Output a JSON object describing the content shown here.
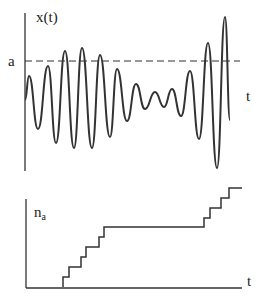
{
  "top_plot": {
    "y_label": "x(t)",
    "x_label": "t",
    "threshold_label": "a",
    "threshold_style": "dashed",
    "wave_points": [
      [
        25,
        100
      ],
      [
        29,
        76
      ],
      [
        38,
        129
      ],
      [
        48,
        66
      ],
      [
        56,
        143
      ],
      [
        65,
        51
      ],
      [
        74,
        148
      ],
      [
        82,
        48
      ],
      [
        92,
        148
      ],
      [
        100,
        55
      ],
      [
        110,
        137
      ],
      [
        117,
        69
      ],
      [
        127,
        121
      ],
      [
        136,
        84
      ],
      [
        145,
        109
      ],
      [
        155,
        92
      ],
      [
        164,
        107
      ],
      [
        172,
        89
      ],
      [
        181,
        116
      ],
      [
        190,
        71
      ],
      [
        199,
        139
      ],
      [
        208,
        43
      ],
      [
        217,
        168
      ],
      [
        225,
        17
      ],
      [
        230,
        120
      ]
    ]
  },
  "bottom_plot": {
    "y_label_main": "n",
    "y_label_sub": "a",
    "x_label": "t",
    "step_points": [
      [
        63,
        287
      ],
      [
        63,
        277
      ],
      [
        69,
        277
      ],
      [
        69,
        267
      ],
      [
        81,
        267
      ],
      [
        81,
        257
      ],
      [
        86,
        257
      ],
      [
        86,
        247
      ],
      [
        99,
        247
      ],
      [
        99,
        237
      ],
      [
        104,
        237
      ],
      [
        104,
        227
      ],
      [
        204,
        227
      ],
      [
        204,
        218
      ],
      [
        210,
        218
      ],
      [
        210,
        208
      ],
      [
        221,
        208
      ],
      [
        221,
        198
      ],
      [
        229,
        198
      ],
      [
        229,
        188
      ],
      [
        242,
        188
      ]
    ]
  },
  "colors": {
    "line": "#333333",
    "background": "#ffffff"
  }
}
